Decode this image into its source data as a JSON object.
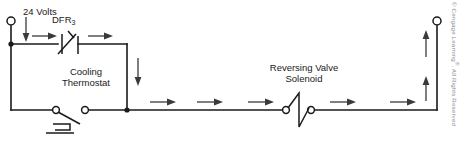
{
  "diagram": {
    "stroke_color": "#1a1a1a",
    "arrow_color": "#3a3a3a",
    "background": "#ffffff",
    "labels": {
      "supply_voltage": "24 Volts",
      "relay_contact": "DFR",
      "relay_contact_subscript": "3",
      "thermostat_line1": "Cooling",
      "thermostat_line2": "Thermostat",
      "solenoid_line1": "Reversing Valve",
      "solenoid_line2": "Solenoid"
    },
    "components": [
      {
        "name": "power-terminal-left",
        "type": "open-terminal",
        "label": "24 Volts",
        "x": 11,
        "y": 20
      },
      {
        "name": "dfr3-contacts",
        "type": "normally-closed-contact",
        "label": "DFR3",
        "x": 68,
        "y": 44,
        "state": "closed"
      },
      {
        "name": "cooling-thermostat",
        "type": "bimetal-thermostat-switch",
        "label": "Cooling Thermostat",
        "x": 70,
        "y": 110,
        "state": "open"
      },
      {
        "name": "reversing-valve-solenoid",
        "type": "solenoid-coil",
        "label": "Reversing Valve Solenoid",
        "x": 297,
        "y": 110
      },
      {
        "name": "power-terminal-right",
        "type": "open-terminal",
        "x": 437,
        "y": 20
      },
      {
        "name": "junction-top-left",
        "type": "junction-dot",
        "x": 11,
        "y": 44
      },
      {
        "name": "junction-bottom-mid",
        "type": "junction-dot",
        "x": 127,
        "y": 110
      }
    ],
    "current_flow_arrows": [
      {
        "name": "flow-arrow-supply-down",
        "direction": "down",
        "x": 26,
        "y_from": 18,
        "y_to": 40
      },
      {
        "name": "flow-arrow-top-1",
        "direction": "right",
        "y": 36,
        "x_from": 32,
        "x_to": 56
      },
      {
        "name": "flow-arrow-top-2",
        "direction": "right",
        "y": 36,
        "x_from": 88,
        "x_to": 112
      },
      {
        "name": "flow-arrow-mid-down",
        "direction": "down",
        "x": 138,
        "y_from": 58,
        "y_to": 86
      },
      {
        "name": "flow-arrow-bottom-1",
        "direction": "right",
        "y": 102,
        "x_from": 150,
        "x_to": 176
      },
      {
        "name": "flow-arrow-bottom-2",
        "direction": "right",
        "y": 102,
        "x_from": 197,
        "x_to": 223
      },
      {
        "name": "flow-arrow-bottom-3",
        "direction": "right",
        "y": 102,
        "x_from": 248,
        "x_to": 274
      },
      {
        "name": "flow-arrow-bottom-4",
        "direction": "right",
        "y": 102,
        "x_from": 330,
        "x_to": 356
      },
      {
        "name": "flow-arrow-bottom-5",
        "direction": "right",
        "y": 102,
        "x_from": 390,
        "x_to": 416
      },
      {
        "name": "flow-arrow-right-up-1",
        "direction": "up",
        "x": 426,
        "y_from": 100,
        "y_to": 76
      },
      {
        "name": "flow-arrow-right-up-2",
        "direction": "up",
        "x": 426,
        "y_from": 56,
        "y_to": 30
      }
    ]
  },
  "copyright": {
    "text": "© Cengage Learning®. All Rights Reserved",
    "prefix": "© Cengage Learning",
    "mark": "®",
    "suffix": ". All Rights Reserved"
  }
}
